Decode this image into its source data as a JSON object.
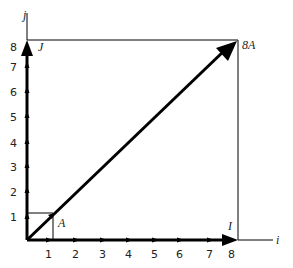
{
  "diagram": {
    "axes": {
      "x_label": "i",
      "y_label": "j",
      "x_ticks": [
        "1",
        "2",
        "3",
        "4",
        "5",
        "6",
        "7",
        "8"
      ],
      "y_ticks": [
        "1",
        "2",
        "3",
        "4",
        "5",
        "6",
        "7",
        "8"
      ]
    },
    "points": {
      "A": "A",
      "eightA": "8A",
      "I": "I",
      "J": "J"
    }
  }
}
